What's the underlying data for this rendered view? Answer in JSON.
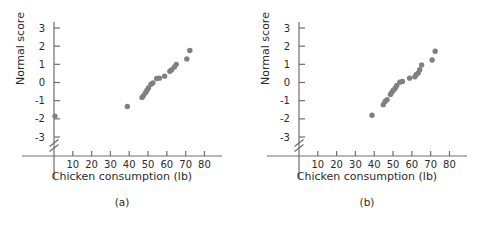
{
  "figure": {
    "background": "#ffffff",
    "point_color": "#808080",
    "axis_color": "#6e6e6e",
    "text_color": "#2b2b2b"
  },
  "chart_data": [
    {
      "type": "scatter",
      "panel_label": "(a)",
      "title": "",
      "xlabel": "Chicken consumption (lb)",
      "ylabel": "Normal score",
      "xlim": [
        0,
        84
      ],
      "ylim": [
        -3.8,
        3.4
      ],
      "xticks": [
        10,
        20,
        30,
        40,
        50,
        60,
        70,
        80
      ],
      "xtick_labels": [
        "10",
        "20",
        "30",
        "40",
        "50",
        "60",
        "70",
        "80"
      ],
      "yticks": [
        -3,
        -2,
        -1,
        0,
        1,
        2,
        3
      ],
      "ytick_labels": [
        "-3",
        "-2",
        "-1",
        "0",
        "1",
        "2",
        "3"
      ],
      "grid": false,
      "legend": null,
      "y_axis_break": true,
      "marker": "circle",
      "marker_color": "#808080",
      "points": [
        {
          "x": 0.5,
          "y": -1.85
        },
        {
          "x": 39.0,
          "y": -1.32
        },
        {
          "x": 46.8,
          "y": -0.82
        },
        {
          "x": 47.6,
          "y": -0.72
        },
        {
          "x": 48.6,
          "y": -0.56
        },
        {
          "x": 49.4,
          "y": -0.44
        },
        {
          "x": 50.2,
          "y": -0.3
        },
        {
          "x": 51.6,
          "y": -0.1
        },
        {
          "x": 52.6,
          "y": -0.02
        },
        {
          "x": 54.6,
          "y": 0.22
        },
        {
          "x": 56.0,
          "y": 0.24
        },
        {
          "x": 58.8,
          "y": 0.35
        },
        {
          "x": 61.6,
          "y": 0.62
        },
        {
          "x": 62.6,
          "y": 0.7
        },
        {
          "x": 64.0,
          "y": 0.86
        },
        {
          "x": 65.0,
          "y": 1.0
        },
        {
          "x": 70.6,
          "y": 1.3
        },
        {
          "x": 72.2,
          "y": 1.76
        }
      ]
    },
    {
      "type": "scatter",
      "panel_label": "(b)",
      "title": "",
      "xlabel": "Chicken consumption (lb)",
      "ylabel": "Normal score",
      "xlim": [
        0,
        84
      ],
      "ylim": [
        -3.8,
        3.4
      ],
      "xticks": [
        10,
        20,
        30,
        40,
        50,
        60,
        70,
        80
      ],
      "xtick_labels": [
        "10",
        "20",
        "30",
        "40",
        "50",
        "60",
        "70",
        "80"
      ],
      "yticks": [
        -3,
        -2,
        -1,
        0,
        1,
        2,
        3
      ],
      "ytick_labels": [
        "-3",
        "-2",
        "-1",
        "0",
        "1",
        "2",
        "3"
      ],
      "grid": false,
      "legend": null,
      "y_axis_break": true,
      "marker": "circle",
      "marker_color": "#808080",
      "points": [
        {
          "x": 38.8,
          "y": -1.8
        },
        {
          "x": 44.8,
          "y": -1.22
        },
        {
          "x": 45.8,
          "y": -1.04
        },
        {
          "x": 46.8,
          "y": -0.94
        },
        {
          "x": 48.6,
          "y": -0.66
        },
        {
          "x": 49.4,
          "y": -0.54
        },
        {
          "x": 50.2,
          "y": -0.42
        },
        {
          "x": 51.2,
          "y": -0.32
        },
        {
          "x": 52.0,
          "y": -0.16
        },
        {
          "x": 53.6,
          "y": 0.02
        },
        {
          "x": 55.0,
          "y": 0.06
        },
        {
          "x": 58.8,
          "y": 0.24
        },
        {
          "x": 61.6,
          "y": 0.32
        },
        {
          "x": 62.4,
          "y": 0.44
        },
        {
          "x": 63.4,
          "y": 0.52
        },
        {
          "x": 64.2,
          "y": 0.7
        },
        {
          "x": 65.2,
          "y": 0.96
        },
        {
          "x": 70.8,
          "y": 1.24
        },
        {
          "x": 72.4,
          "y": 1.72
        }
      ]
    }
  ],
  "panels": [
    {
      "id": "a",
      "caption": "(a)",
      "xlabel": "Chicken consumption (lb)",
      "ylabel": "Normal score"
    },
    {
      "id": "b",
      "caption": "(b)",
      "xlabel": "Chicken consumption (lb)",
      "ylabel": "Normal score"
    }
  ]
}
